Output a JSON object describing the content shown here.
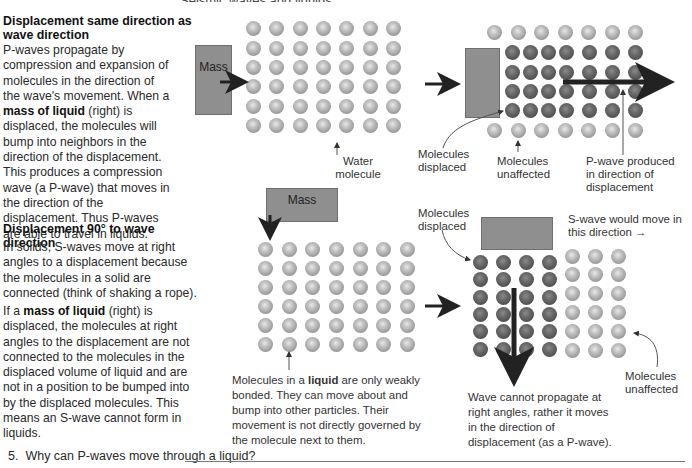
{
  "top_cut_heading": "Seismic waves and liquids",
  "section1": {
    "heading": "Displacement same direction as wave direction",
    "paragraph_parts": [
      {
        "t": "P-waves propagate by compression and expansion of molecules in the direction of the wave's movement. When a ",
        "b": false
      },
      {
        "t": "mass of liquid",
        "b": true
      },
      {
        "t": " (right) is displaced, the molecules will bump into neighbors in the direction of the displacement. This produces a compression wave (a P-wave) that moves in the direction of the displacement. Thus P-waves are able to travel in liquids.",
        "b": false
      }
    ]
  },
  "section2": {
    "heading": "Displacement 90° to wave direction",
    "paragraph1": "In solids, S-waves move at right angles to a displacement because the molecules in a solid are connected (think of shaking a rope).",
    "paragraph2_parts": [
      {
        "t": "If a ",
        "b": false
      },
      {
        "t": "mass of liquid",
        "b": true
      },
      {
        "t": " (right) is displaced, the molecules at right angles to the displacement are not connected to the molecules in the displaced volume of liquid and are not in a position to be bumped into by the displaced molecules. This means an S-wave cannot form in liquids.",
        "b": false
      }
    ]
  },
  "diagram_top": {
    "mass_label": "Mass",
    "water_molecule_label": "Water molecule",
    "molecules_displaced_label": "Molecules displaced",
    "molecules_unaffected_label": "Molecules unaffected",
    "pwave_label": "P-wave produced in direction of displacement"
  },
  "diagram_bottom": {
    "mass_label": "Mass",
    "molecules_displaced_label": "Molecules displaced",
    "swave_label": "S-wave would move in this direction →",
    "molecules_unaffected_label": "Molecules unaffected",
    "liquid_caption_parts": [
      {
        "t": "Molecules in a ",
        "b": false
      },
      {
        "t": "liquid",
        "b": true
      },
      {
        "t": " are only weakly bonded. They can  move about and bump into other particles. Their movement is not directly governed by the molecule next to them.",
        "b": false
      }
    ],
    "wave_caption": "Wave cannot propagate at right angles, rather it moves in the direction of displacement (as a P-wave)."
  },
  "question": {
    "number": "5.",
    "text": "Why can P-waves move through a liquid?"
  },
  "colors": {
    "mass_fill": "#8f8f8f",
    "sphere_light": "#c4c4c4",
    "sphere_dark": "#4e4e4e",
    "arrow": "#222222"
  }
}
